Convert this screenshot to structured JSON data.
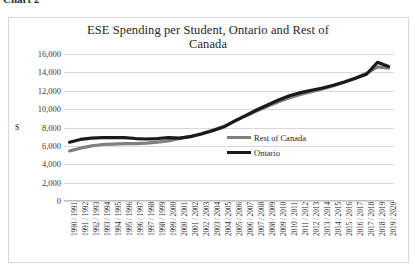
{
  "caption": {
    "text": "Chart 2"
  },
  "chart_data": {
    "type": "line",
    "title": "ESE Spending per Student, Ontario and Rest of Canada",
    "title_line1": "ESE Spending per Student, Ontario and Rest of",
    "title_line2": "Canada",
    "xlabel": "",
    "ylabel": "$",
    "ylim": [
      0,
      16000
    ],
    "ytick_labels": [
      "16,000",
      "14,000",
      "12,000",
      "10,000",
      "8,000",
      "6,000",
      "4,000",
      "2,000",
      "0"
    ],
    "ytick_values": [
      16000,
      14000,
      12000,
      10000,
      8000,
      6000,
      4000,
      2000,
      0
    ],
    "grid": true,
    "legend_position": "inside-right-middle",
    "categories": [
      "1990 / 1991",
      "1991 / 1992",
      "1992 / 1993",
      "1993 / 1994",
      "1994 / 1995",
      "1995 / 1996",
      "1996 / 1997",
      "1997 / 1998",
      "1998 / 1999",
      "1999 / 2000",
      "2000 / 2001",
      "2001 / 2002",
      "2002 / 2003",
      "2003 / 2004",
      "2004 / 2005",
      "2005 / 2006",
      "2006 / 2007",
      "2007 / 2008",
      "2008 / 2009",
      "2009 / 2010",
      "2010 / 2011",
      "2011 / 2012",
      "2012 / 2013",
      "2013 / 2014",
      "2014 / 2015",
      "2015 / 2016",
      "2016 / 2017",
      "2017 / 2018",
      "2018 / 2019",
      "2019 / 2020"
    ],
    "series": [
      {
        "name": "Rest of Canada",
        "color": "#808080",
        "values": [
          5450,
          5750,
          6000,
          6150,
          6200,
          6250,
          6250,
          6300,
          6400,
          6550,
          6800,
          7050,
          7350,
          7700,
          8100,
          8700,
          9250,
          9800,
          10300,
          10800,
          11250,
          11600,
          11900,
          12200,
          12550,
          12950,
          13400,
          13900,
          14600,
          14450
        ]
      },
      {
        "name": "Ontario",
        "color": "#1a1a1a",
        "values": [
          6400,
          6700,
          6850,
          6900,
          6900,
          6900,
          6800,
          6750,
          6800,
          6900,
          6850,
          7000,
          7300,
          7650,
          8050,
          8700,
          9300,
          9900,
          10450,
          11000,
          11450,
          11800,
          12050,
          12300,
          12600,
          12950,
          13350,
          13800,
          15100,
          14650
        ]
      }
    ]
  }
}
